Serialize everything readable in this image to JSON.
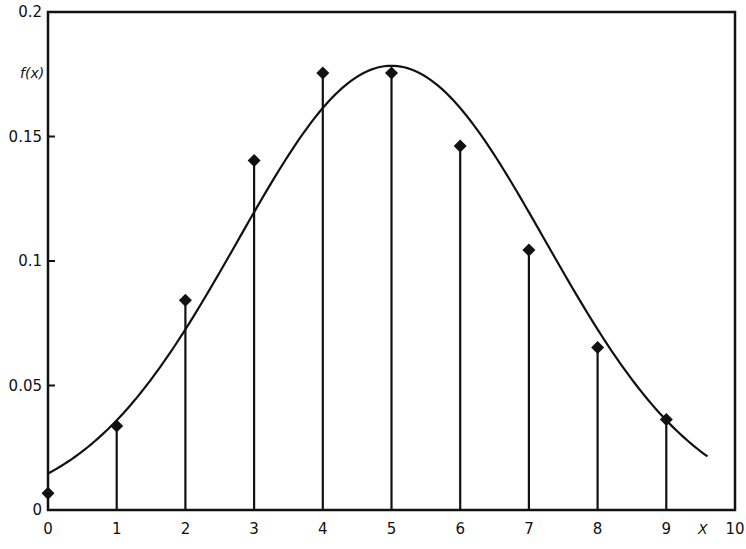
{
  "chart_data": {
    "type": "bar",
    "subtype": "stem-with-curve",
    "title": "",
    "xlabel": "X",
    "ylabel": "f(x)",
    "xlim": [
      0,
      10
    ],
    "ylim": [
      0,
      0.2
    ],
    "grid": false,
    "legend": null,
    "x_ticks": [
      "0",
      "1",
      "2",
      "3",
      "4",
      "5",
      "6",
      "7",
      "8",
      "9",
      "10"
    ],
    "y_ticks": [
      "0",
      "0.05",
      "0.1",
      "0.15",
      "0.2"
    ],
    "series": [
      {
        "name": "Poisson pmf (stems with diamond markers)",
        "x": [
          0,
          1,
          2,
          3,
          4,
          5,
          6,
          7,
          8,
          9
        ],
        "values": [
          0.0067,
          0.0337,
          0.0842,
          0.1404,
          0.1755,
          0.1755,
          0.1462,
          0.1044,
          0.0653,
          0.0363
        ]
      },
      {
        "name": "Normal approximation curve",
        "mean": 5,
        "sd": 2.236,
        "x_range": [
          0,
          9.6
        ]
      }
    ]
  }
}
